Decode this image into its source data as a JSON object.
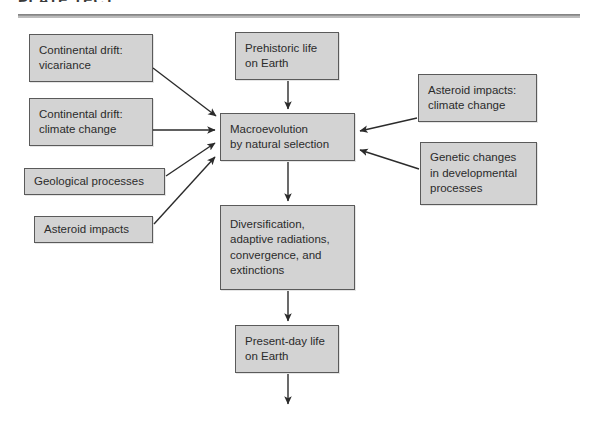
{
  "header": {
    "title": "PLATE TECT",
    "rule_color": "#8a8a8a"
  },
  "diagram": {
    "box_fill": "#d3d3d3",
    "box_border": "#5a5a5a",
    "arrow_color": "#2b2b2b",
    "nodes": [
      {
        "id": "continental-drift-vicariance",
        "label": "Continental drift:\nvicariance",
        "x": 29,
        "y": 34,
        "w": 124,
        "h": 48,
        "align": "left"
      },
      {
        "id": "continental-drift-climate-change",
        "label": "Continental drift:\nclimate change",
        "x": 29,
        "y": 98,
        "w": 124,
        "h": 48,
        "align": "left"
      },
      {
        "id": "geological-processes",
        "label": "Geological processes",
        "x": 24,
        "y": 168,
        "w": 141,
        "h": 27,
        "align": "left"
      },
      {
        "id": "asteroid-impacts",
        "label": "Asteroid impacts",
        "x": 34,
        "y": 216,
        "w": 119,
        "h": 27,
        "align": "left"
      },
      {
        "id": "prehistoric-life-on-earth",
        "label": "Prehistoric life\non Earth",
        "x": 235,
        "y": 32,
        "w": 104,
        "h": 48,
        "align": "left"
      },
      {
        "id": "macroevolution-by-natural-selection",
        "label": "Macroevolution\nby natural selection",
        "x": 220,
        "y": 113,
        "w": 135,
        "h": 48,
        "align": "left"
      },
      {
        "id": "asteroid-impacts-climate-change",
        "label": "Asteroid impacts:\nclimate change",
        "x": 418,
        "y": 74,
        "w": 119,
        "h": 48,
        "align": "left"
      },
      {
        "id": "genetic-changes-in-developmental-processes",
        "label": "Genetic changes\nin developmental\nprocesses",
        "x": 420,
        "y": 142,
        "w": 117,
        "h": 63,
        "align": "left"
      },
      {
        "id": "diversification-adaptive-radiations",
        "label": "Diversification,\nadaptive radiations,\nconvergence, and\nextinctions",
        "x": 220,
        "y": 205,
        "w": 135,
        "h": 85,
        "align": "left"
      },
      {
        "id": "present-day-life-on-earth",
        "label": "Present-day life\non Earth",
        "x": 235,
        "y": 325,
        "w": 104,
        "h": 48,
        "align": "left"
      }
    ],
    "edges": [
      {
        "id": "edge-vicariance-to-macroevolution",
        "from": "continental-drift-vicariance",
        "to": "macroevolution-by-natural-selection",
        "path": "M 153,68 L 216,116"
      },
      {
        "id": "edge-drift-climate-to-macroevolution",
        "from": "continental-drift-climate-change",
        "to": "macroevolution-by-natural-selection",
        "path": "M 153,130 L 215,130"
      },
      {
        "id": "edge-geological-to-macroevolution",
        "from": "geological-processes",
        "to": "macroevolution-by-natural-selection",
        "path": "M 166,176 L 215,143"
      },
      {
        "id": "edge-asteroid-to-macroevolution",
        "from": "asteroid-impacts",
        "to": "macroevolution-by-natural-selection",
        "path": "M 154,224 L 215,157"
      },
      {
        "id": "edge-prehistoric-to-macroevolution",
        "from": "prehistoric-life-on-earth",
        "to": "macroevolution-by-natural-selection",
        "path": "M 288,81 L 288,109"
      },
      {
        "id": "edge-asteroid-climate-to-macroevolution",
        "from": "asteroid-impacts-climate-change",
        "to": "macroevolution-by-natural-selection",
        "path": "M 417,118 L 360,131"
      },
      {
        "id": "edge-genetic-to-macroevolution",
        "from": "genetic-changes-in-developmental-processes",
        "to": "macroevolution-by-natural-selection",
        "path": "M 419,169 L 360,150"
      },
      {
        "id": "edge-macroevolution-to-diversification",
        "from": "macroevolution-by-natural-selection",
        "to": "diversification-adaptive-radiations",
        "path": "M 288,162 L 288,201"
      },
      {
        "id": "edge-diversification-to-present-day",
        "from": "diversification-adaptive-radiations",
        "to": "present-day-life-on-earth",
        "path": "M 288,291 L 288,321"
      },
      {
        "id": "edge-present-day-to-future",
        "from": "present-day-life-on-earth",
        "to": null,
        "path": "M 288,374 L 288,404"
      }
    ]
  }
}
